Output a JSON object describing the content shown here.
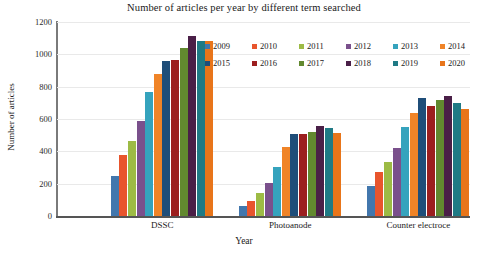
{
  "chart_data": {
    "type": "bar",
    "title": "Number of articles per year by different term searched",
    "xlabel": "Year",
    "ylabel": "Number of articles",
    "ylim": [
      0,
      1200
    ],
    "yticks": [
      0,
      200,
      400,
      600,
      800,
      1000,
      1200
    ],
    "ytick_labels": [
      "0",
      "200",
      "400",
      "600",
      "800",
      "1000",
      "1200"
    ],
    "grid": true,
    "legend_position": "upper right, inside plot, two rows",
    "categories": [
      "DSSC",
      "Photoanode",
      "Counter electroce"
    ],
    "series": [
      {
        "name": "2009",
        "color": "#4277ad",
        "values": [
          250,
          65,
          185
        ]
      },
      {
        "name": "2010",
        "color": "#e8552d",
        "values": [
          375,
          95,
          270
        ]
      },
      {
        "name": "2011",
        "color": "#9dbb45",
        "values": [
          465,
          145,
          335
        ]
      },
      {
        "name": "2012",
        "color": "#7a508c",
        "values": [
          590,
          205,
          420
        ]
      },
      {
        "name": "2013",
        "color": "#35a3bd",
        "values": [
          770,
          305,
          550
        ]
      },
      {
        "name": "2014",
        "color": "#f08427",
        "values": [
          880,
          425,
          635
        ]
      },
      {
        "name": "2015",
        "color": "#1f4e79",
        "values": [
          960,
          510,
          730
        ]
      },
      {
        "name": "2016",
        "color": "#9c1f1f",
        "values": [
          965,
          510,
          680
        ]
      },
      {
        "name": "2017",
        "color": "#62892f",
        "values": [
          1040,
          520,
          715
        ]
      },
      {
        "name": "2018",
        "color": "#4a1f47",
        "values": [
          1115,
          555,
          740
        ]
      },
      {
        "name": "2019",
        "color": "#1f7a85",
        "values": [
          1085,
          545,
          700
        ]
      },
      {
        "name": "2020",
        "color": "#e8751a",
        "values": [
          1085,
          515,
          660
        ]
      }
    ]
  }
}
